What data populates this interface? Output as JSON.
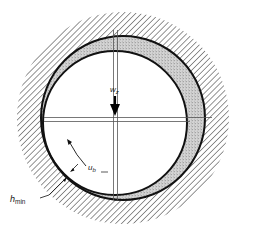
{
  "diagram": {
    "labels": {
      "load": "w",
      "load_sub": "z",
      "velocity": "u",
      "velocity_sub": "b",
      "min_film": "h",
      "min_film_sub": "min"
    },
    "components": [
      "bearing-housing",
      "journal",
      "lubricant-film",
      "load-arrow",
      "rotation-arrow",
      "centerlines"
    ],
    "colors": {
      "line": "#111111",
      "hatch": "#2a2a2a",
      "film": "#bdbdbd",
      "background": "#ffffff"
    }
  }
}
